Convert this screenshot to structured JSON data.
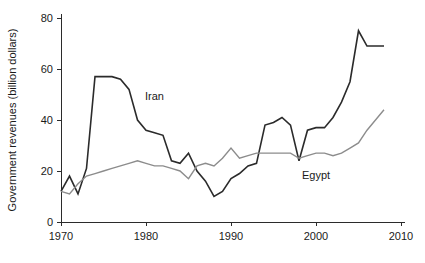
{
  "chart_data": {
    "type": "line",
    "title": "",
    "xlabel": "",
    "ylabel": "Government revenues (billion dollars)",
    "xlim": [
      1970,
      2010
    ],
    "ylim": [
      0,
      80
    ],
    "xticks": [
      1970,
      1980,
      1990,
      2000,
      2010
    ],
    "yticks": [
      0,
      20,
      40,
      60,
      80
    ],
    "grid": false,
    "legend_position": "inline-annotations",
    "x": [
      1970,
      1971,
      1972,
      1973,
      1974,
      1975,
      1976,
      1977,
      1978,
      1979,
      1980,
      1981,
      1982,
      1983,
      1984,
      1985,
      1986,
      1987,
      1988,
      1989,
      1990,
      1991,
      1992,
      1993,
      1994,
      1995,
      1996,
      1997,
      1998,
      1999,
      2000,
      2001,
      2002,
      2003,
      2004,
      2005,
      2006,
      2007,
      2008
    ],
    "series": [
      {
        "name": "Iran",
        "color": "#2b2b2b",
        "width": 1.6,
        "label_x": 1981,
        "label_y": 48,
        "values": [
          12,
          18,
          11,
          21,
          57,
          57,
          57,
          56,
          52,
          40,
          36,
          35,
          34,
          24,
          23,
          27,
          20,
          16,
          10,
          12,
          17,
          19,
          22,
          23,
          38,
          39,
          41,
          38,
          24,
          36,
          37,
          37,
          41,
          47,
          55,
          75,
          69,
          69,
          69
        ]
      },
      {
        "name": "Egypt",
        "color": "#8c8c8c",
        "width": 1.4,
        "label_x": 2000,
        "label_y": 17,
        "values": [
          12,
          11,
          15,
          18,
          19,
          20,
          21,
          22,
          23,
          24,
          23,
          22,
          22,
          21,
          20,
          17,
          22,
          23,
          22,
          25,
          29,
          25,
          26,
          27,
          27,
          27,
          27,
          27,
          25,
          26,
          27,
          27,
          26,
          27,
          29,
          31,
          36,
          40,
          44
        ]
      }
    ],
    "annotations": [
      {
        "text": "Iran",
        "x": 1981,
        "y": 48
      },
      {
        "text": "Egypt",
        "x": 2000,
        "y": 17
      }
    ]
  },
  "axis": {
    "y_title": "Government revenues (billion dollars)",
    "y_tick_labels": [
      "0",
      "20",
      "40",
      "60",
      "80"
    ],
    "x_tick_labels": [
      "1970",
      "1980",
      "1990",
      "2000",
      "2010"
    ]
  },
  "labels": {
    "iran": "Iran",
    "egypt": "Egypt"
  }
}
